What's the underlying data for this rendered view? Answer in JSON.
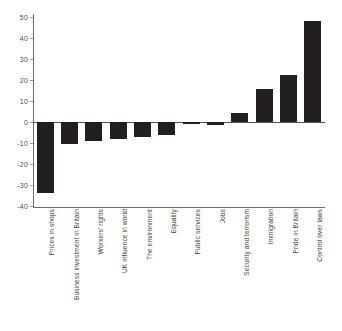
{
  "chart_data": {
    "type": "bar",
    "title": "",
    "subtitle": "",
    "xlabel": "",
    "ylabel": "",
    "ylim": [
      -40,
      50
    ],
    "grid": false,
    "legend": false,
    "orientation": "vertical",
    "bar_color": "#231f20",
    "axis_color": "#6e6e6e",
    "zero_line": 0,
    "yticks": [
      50,
      40,
      30,
      20,
      10,
      0,
      -10,
      -20,
      -30,
      -40
    ],
    "ytick_labels": [
      "50",
      "40",
      "30",
      "20",
      "10",
      "0",
      "-10",
      "-20",
      "-30",
      "-40"
    ],
    "categories": [
      "Prices in shops",
      "Business investment in Britain",
      "Workers' rights",
      "UK influence in world",
      "The environment",
      "Equality",
      "Public services",
      "Jobs",
      "Security and terrorism",
      "Immigration",
      "Pride in Britain",
      "Control over laws"
    ],
    "values": [
      -34,
      -10.5,
      -9,
      -8,
      -7,
      -6,
      -1,
      -1.5,
      4.5,
      15.5,
      22.5,
      48
    ]
  }
}
